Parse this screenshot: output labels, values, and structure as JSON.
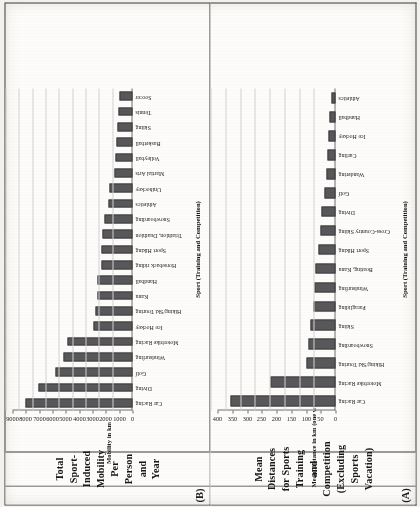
{
  "figure": {
    "panels": [
      {
        "tag": "(B)",
        "title": "Total Sport-Induced Mobility Per Person and Year",
        "chart_ref": 1
      },
      {
        "tag": "(A)",
        "title": "Mean Distances for Sports Training and Competition (Excluding Sports Vacation)",
        "chart_ref": 0
      }
    ]
  },
  "chart_data": [
    {
      "type": "bar",
      "panel": "(A)",
      "title": "Mean Distances for Sports Training and Competition (Excluding Sports Vacation)",
      "xlabel": "Sport (Training and Competition)",
      "ylabel": "Mean Distance in km (one way)",
      "ylim": [
        0,
        400
      ],
      "yticks": [
        0,
        50,
        100,
        150,
        200,
        250,
        300,
        350,
        400
      ],
      "grid": true,
      "legend": "none",
      "bar_color": "#58585a",
      "categories": [
        "Car Racing",
        "Motorbike Racing",
        "Hiking/Ski Touring",
        "Snowboarding",
        "Skiing",
        "Paragliding",
        "Windsurfing",
        "Boating, Kanu",
        "Sport Hiking",
        "Cross-Country Skiing",
        "Diving",
        "Golf",
        "Wandering",
        "Curling",
        "Ice Hockey",
        "Handball",
        "Athletics"
      ],
      "values": [
        355,
        222,
        98,
        91,
        86,
        76,
        70,
        68,
        57,
        50,
        47,
        39,
        30,
        27,
        24,
        19,
        13
      ]
    },
    {
      "type": "bar",
      "panel": "(B)",
      "title": "Total Sport-Induced Mobility Per Person and Year",
      "xlabel": "Sport (Training and Competition)",
      "ylabel": "Mobility in km",
      "ylim": [
        0,
        9000
      ],
      "yticks": [
        0,
        1000,
        2000,
        3000,
        4000,
        5000,
        6000,
        7000,
        8000,
        9000
      ],
      "grid": true,
      "legend": "none",
      "bar_color": "#58585a",
      "categories": [
        "Car Racing",
        "Diving",
        "Golf",
        "Windsurfing",
        "Motorbike Racing",
        "Ice Hockey",
        "Hiking/Ski Touring",
        "Kanu",
        "Handball",
        "Horseback riding",
        "Sport Hiking",
        "Triathlon, Duathlon",
        "Snowboarding",
        "Athletics",
        "Unihockey",
        "Martial Arts",
        "Volleyball",
        "Basketball",
        "Skiing",
        "Tennis",
        "Soccer"
      ],
      "values": [
        8050,
        7020,
        5800,
        5200,
        4900,
        2950,
        2750,
        2620,
        2600,
        2350,
        2300,
        2250,
        2100,
        1800,
        1700,
        1350,
        1250,
        1200,
        1100,
        1050,
        1000
      ]
    }
  ]
}
